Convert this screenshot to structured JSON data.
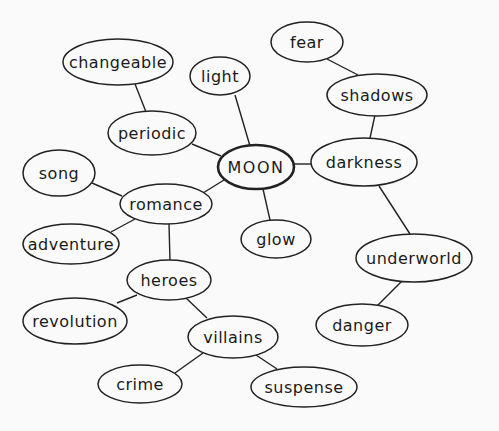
{
  "diagram": {
    "title": "MOON",
    "type": "mind-map",
    "colors": {
      "background": "#fafafa",
      "stroke": "#222222",
      "text": "#1a1a1a"
    },
    "nodes": [
      {
        "id": "moon",
        "label": "MOON",
        "cx": 256,
        "cy": 167,
        "rx": 38,
        "ry": 22,
        "center": true
      },
      {
        "id": "light",
        "label": "light",
        "cx": 220,
        "cy": 76,
        "rx": 30,
        "ry": 19
      },
      {
        "id": "periodic",
        "label": "periodic",
        "cx": 152,
        "cy": 133,
        "rx": 44,
        "ry": 22
      },
      {
        "id": "changeable",
        "label": "changeable",
        "cx": 118,
        "cy": 62,
        "rx": 55,
        "ry": 23
      },
      {
        "id": "romance",
        "label": "romance",
        "cx": 166,
        "cy": 204,
        "rx": 46,
        "ry": 20
      },
      {
        "id": "song",
        "label": "song",
        "cx": 59,
        "cy": 173,
        "rx": 36,
        "ry": 23
      },
      {
        "id": "adventure",
        "label": "adventure",
        "cx": 71,
        "cy": 244,
        "rx": 48,
        "ry": 20
      },
      {
        "id": "heroes",
        "label": "heroes",
        "cx": 169,
        "cy": 280,
        "rx": 42,
        "ry": 20
      },
      {
        "id": "revolution",
        "label": "revolution",
        "cx": 75,
        "cy": 321,
        "rx": 52,
        "ry": 23
      },
      {
        "id": "villains",
        "label": "villains",
        "cx": 233,
        "cy": 337,
        "rx": 45,
        "ry": 21
      },
      {
        "id": "crime",
        "label": "crime",
        "cx": 140,
        "cy": 384,
        "rx": 42,
        "ry": 19
      },
      {
        "id": "suspense",
        "label": "suspense",
        "cx": 304,
        "cy": 387,
        "rx": 53,
        "ry": 20
      },
      {
        "id": "glow",
        "label": "glow",
        "cx": 276,
        "cy": 239,
        "rx": 35,
        "ry": 19
      },
      {
        "id": "darkness",
        "label": "darkness",
        "cx": 364,
        "cy": 162,
        "rx": 53,
        "ry": 24
      },
      {
        "id": "shadows",
        "label": "shadows",
        "cx": 377,
        "cy": 95,
        "rx": 50,
        "ry": 21
      },
      {
        "id": "fear",
        "label": "fear",
        "cx": 307,
        "cy": 42,
        "rx": 36,
        "ry": 20
      },
      {
        "id": "underworld",
        "label": "underworld",
        "cx": 414,
        "cy": 258,
        "rx": 58,
        "ry": 24
      },
      {
        "id": "danger",
        "label": "danger",
        "cx": 362,
        "cy": 325,
        "rx": 46,
        "ry": 21
      }
    ],
    "edges": [
      {
        "from": "moon",
        "to": "light",
        "x1": 250,
        "y1": 146,
        "x2": 235,
        "y2": 95
      },
      {
        "from": "moon",
        "to": "periodic",
        "x1": 221,
        "y1": 156,
        "x2": 192,
        "y2": 144
      },
      {
        "from": "periodic",
        "to": "changeable",
        "x1": 146,
        "y1": 112,
        "x2": 135,
        "y2": 84
      },
      {
        "from": "moon",
        "to": "romance",
        "x1": 224,
        "y1": 180,
        "x2": 203,
        "y2": 193
      },
      {
        "from": "romance",
        "to": "song",
        "x1": 122,
        "y1": 196,
        "x2": 92,
        "y2": 183
      },
      {
        "from": "romance",
        "to": "adventure",
        "x1": 135,
        "y1": 219,
        "x2": 111,
        "y2": 232
      },
      {
        "from": "romance",
        "to": "heroes",
        "x1": 169,
        "y1": 224,
        "x2": 170,
        "y2": 261
      },
      {
        "from": "heroes",
        "to": "revolution",
        "x1": 137,
        "y1": 295,
        "x2": 117,
        "y2": 303
      },
      {
        "from": "heroes",
        "to": "villains",
        "x1": 186,
        "y1": 298,
        "x2": 207,
        "y2": 318
      },
      {
        "from": "villains",
        "to": "crime",
        "x1": 203,
        "y1": 353,
        "x2": 175,
        "y2": 373
      },
      {
        "from": "villains",
        "to": "suspense",
        "x1": 256,
        "y1": 355,
        "x2": 277,
        "y2": 369
      },
      {
        "from": "moon",
        "to": "glow",
        "x1": 263,
        "y1": 189,
        "x2": 270,
        "y2": 220
      },
      {
        "from": "moon",
        "to": "darkness",
        "x1": 294,
        "y1": 164,
        "x2": 311,
        "y2": 164
      },
      {
        "from": "darkness",
        "to": "shadows",
        "x1": 370,
        "y1": 138,
        "x2": 375,
        "y2": 115
      },
      {
        "from": "shadows",
        "to": "fear",
        "x1": 358,
        "y1": 75,
        "x2": 327,
        "y2": 59
      },
      {
        "from": "darkness",
        "to": "underworld",
        "x1": 379,
        "y1": 186,
        "x2": 410,
        "y2": 234
      },
      {
        "from": "underworld",
        "to": "danger",
        "x1": 402,
        "y1": 281,
        "x2": 377,
        "y2": 306
      }
    ]
  }
}
